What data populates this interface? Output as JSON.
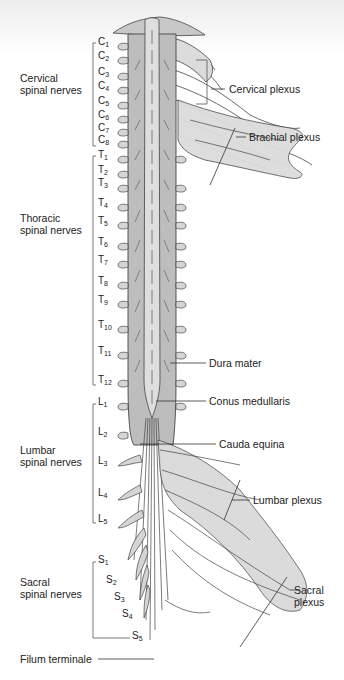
{
  "regions": {
    "cervical": {
      "label_line1": "Cervical",
      "label_line2": "spinal nerves"
    },
    "thoracic": {
      "label_line1": "Thoracic",
      "label_line2": "spinal nerves"
    },
    "lumbar": {
      "label_line1": "Lumbar",
      "label_line2": "spinal nerves"
    },
    "sacral": {
      "label_line1": "Sacral",
      "label_line2": "spinal nerves"
    }
  },
  "segments": {
    "C": [
      {
        "l": "C",
        "n": "1",
        "y": 42
      },
      {
        "l": "C",
        "n": "2",
        "y": 56
      },
      {
        "l": "C",
        "n": "3",
        "y": 72
      },
      {
        "l": "C",
        "n": "4",
        "y": 86
      },
      {
        "l": "C",
        "n": "5",
        "y": 101
      },
      {
        "l": "C",
        "n": "6",
        "y": 115
      },
      {
        "l": "C",
        "n": "7",
        "y": 128
      },
      {
        "l": "C",
        "n": "8",
        "y": 140
      }
    ],
    "T": [
      {
        "l": "T",
        "n": "1",
        "y": 155
      },
      {
        "l": "T",
        "n": "2",
        "y": 170
      },
      {
        "l": "T",
        "n": "3",
        "y": 183
      },
      {
        "l": "T",
        "n": "4",
        "y": 203
      },
      {
        "l": "T",
        "n": "5",
        "y": 221
      },
      {
        "l": "T",
        "n": "6",
        "y": 242
      },
      {
        "l": "T",
        "n": "7",
        "y": 260
      },
      {
        "l": "T",
        "n": "8",
        "y": 281
      },
      {
        "l": "T",
        "n": "9",
        "y": 300
      },
      {
        "l": "T",
        "n": "10",
        "y": 325
      },
      {
        "l": "T",
        "n": "11",
        "y": 351
      },
      {
        "l": "T",
        "n": "12",
        "y": 380
      }
    ],
    "L": [
      {
        "l": "L",
        "n": "1",
        "y": 402
      },
      {
        "l": "L",
        "n": "2",
        "y": 432
      },
      {
        "l": "L",
        "n": "3",
        "y": 461
      },
      {
        "l": "L",
        "n": "4",
        "y": 493
      },
      {
        "l": "L",
        "n": "5",
        "y": 519
      }
    ],
    "S": [
      {
        "l": "S",
        "n": "1",
        "y": 560,
        "x": 98
      },
      {
        "l": "S",
        "n": "2",
        "y": 580,
        "x": 106
      },
      {
        "l": "S",
        "n": "3",
        "y": 597,
        "x": 114
      },
      {
        "l": "S",
        "n": "4",
        "y": 614,
        "x": 122
      },
      {
        "l": "S",
        "n": "5",
        "y": 636,
        "x": 132
      }
    ]
  },
  "annotations": {
    "cervical_plexus": "Cervical plexus",
    "brachial_plexus": "Brachial plexus",
    "dura_mater": "Dura mater",
    "conus_medullaris": "Conus medullaris",
    "cauda_equina": "Cauda equina",
    "lumbar_plexus": "Lumbar plexus",
    "sacral_plexus_line1": "Sacral",
    "sacral_plexus_line2": "plexus",
    "filum_terminale": "Filum terminale"
  },
  "colors": {
    "nerve_fill": "#d9d9d9",
    "dura_fill": "#bfbfbf",
    "outline": "#333333",
    "text": "#222222"
  }
}
